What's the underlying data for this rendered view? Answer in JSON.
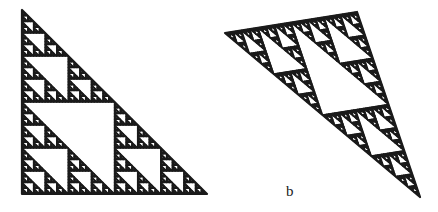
{
  "figure": {
    "background": "#ffffff",
    "ink_color": "#1a1a1a",
    "panels": [
      {
        "id": "a",
        "label": "",
        "type": "sierpinski-triangle",
        "depth": 6,
        "vertices": [
          [
            22,
            10
          ],
          [
            22,
            194
          ],
          [
            207,
            194
          ]
        ],
        "stroke_width": 1.4
      },
      {
        "id": "b",
        "label": "b",
        "label_position": [
          286,
          184
        ],
        "type": "sierpinski-triangle",
        "depth": 6,
        "vertices": [
          [
            225,
            33
          ],
          [
            357,
            12
          ],
          [
            420,
            197
          ]
        ],
        "stroke_width": 1.4
      }
    ]
  }
}
